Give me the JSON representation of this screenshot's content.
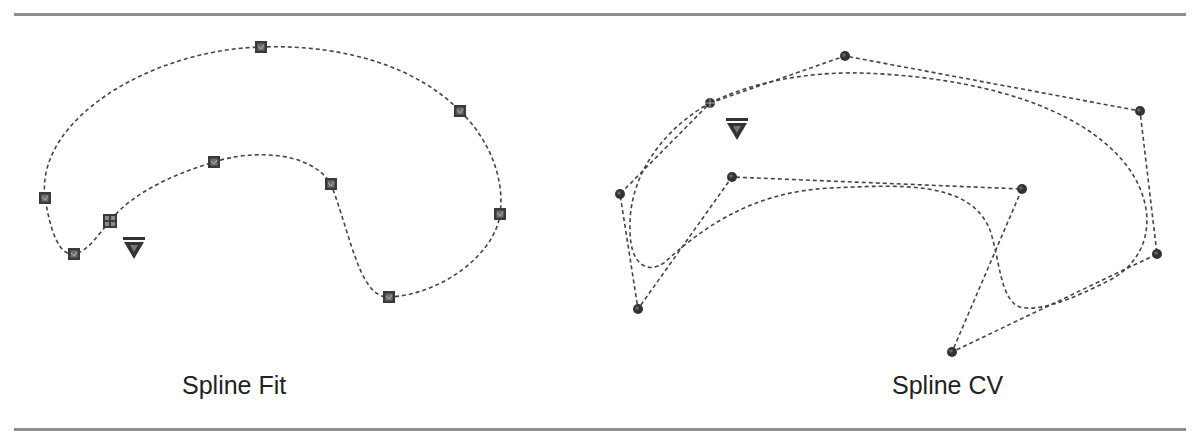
{
  "figure": {
    "colors": {
      "rule": "#8f8f8f",
      "curve": "#444444",
      "point_fill": "#3a3a3a",
      "point_inner": "#7a7a7a",
      "text": "#222222"
    },
    "panels": [
      {
        "id": "spline-fit",
        "caption": "Spline Fit",
        "point_style": "square",
        "start_marker": "grid-square",
        "direction_marker": "down-triangle",
        "fit_points": [
          [
            110,
            221
          ],
          [
            74,
            254
          ],
          [
            45,
            198
          ],
          [
            261,
            47
          ],
          [
            460,
            111
          ],
          [
            500,
            214
          ],
          [
            389,
            297
          ],
          [
            331,
            184
          ],
          [
            214,
            162
          ]
        ]
      },
      {
        "id": "spline-cv",
        "caption": "Spline CV",
        "point_style": "circle",
        "start_marker": "grid-circle",
        "direction_marker": "down-triangle",
        "control_vertices": [
          [
            710,
            103
          ],
          [
            845,
            56
          ],
          [
            1140,
            111
          ],
          [
            1157,
            254
          ],
          [
            952,
            352
          ],
          [
            1022,
            189
          ],
          [
            732,
            177
          ],
          [
            638,
            309
          ],
          [
            620,
            194
          ]
        ]
      }
    ]
  }
}
